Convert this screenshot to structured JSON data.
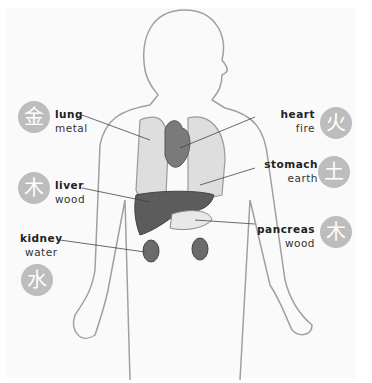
{
  "organs": [
    {
      "name": "lung",
      "element": "metal",
      "glyph": "金",
      "side": "left"
    },
    {
      "name": "liver",
      "element": "wood",
      "glyph": "木",
      "side": "left"
    },
    {
      "name": "kidney",
      "element": "water",
      "glyph": "水",
      "side": "left"
    },
    {
      "name": "heart",
      "element": "fire",
      "glyph": "火",
      "side": "right"
    },
    {
      "name": "stomach",
      "element": "earth",
      "glyph": "土",
      "side": "right"
    },
    {
      "name": "pancreas",
      "element": "wood",
      "glyph": "木",
      "side": "right"
    }
  ],
  "colors": {
    "badge": "#bdbdbd",
    "organ_dark": "#6b6b6b",
    "lung": "#dcdcdc",
    "outline": "#9a9a9a"
  }
}
